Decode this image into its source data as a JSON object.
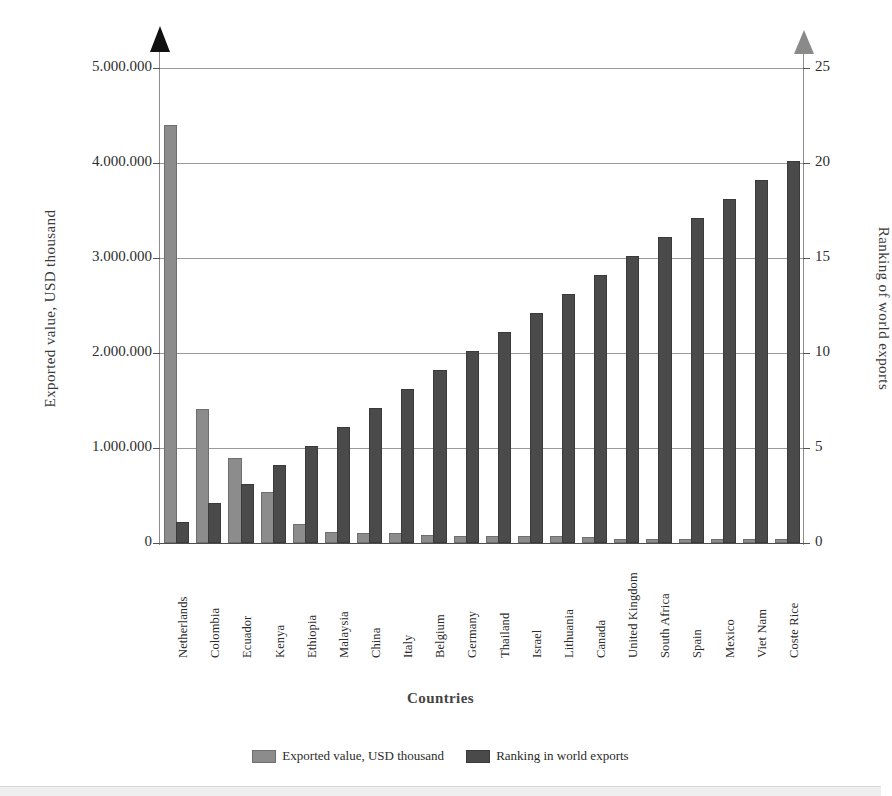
{
  "chart_data": {
    "type": "bar",
    "title": "",
    "xlabel": "Countries",
    "ylabel": "Exported value, USD thousand",
    "y2label": "Ranking of world exports",
    "ylim": [
      0,
      5000000
    ],
    "y2lim": [
      0,
      25
    ],
    "yticks": [
      "0",
      "1.000.000",
      "2.000.000",
      "3.000.000",
      "4.000.000",
      "5.000.000"
    ],
    "ytick_values": [
      0,
      1000000,
      2000000,
      3000000,
      4000000,
      5000000
    ],
    "y2ticks": [
      "0",
      "5",
      "10",
      "15",
      "20",
      "25"
    ],
    "y2tick_values": [
      0,
      5,
      10,
      15,
      20,
      25
    ],
    "grid": true,
    "legend_position": "bottom",
    "categories": [
      "Netherlands",
      "Colombia",
      "Ecuador",
      "Kenya",
      "Ethiopia",
      "Malaysia",
      "China",
      "Italy",
      "Belgium",
      "Germany",
      "Thailand",
      "Israel",
      "Lithuania",
      "Canada",
      "United Kingdom",
      "South Africa",
      "Spain",
      "Mexico",
      "Viet Nam",
      "Coste Rice"
    ],
    "series": [
      {
        "name": "Exported value, USD thousand",
        "axis": "left",
        "color": "#8c8c8c",
        "values": [
          4380000,
          1390000,
          870000,
          520000,
          180000,
          90000,
          85000,
          80000,
          65000,
          55000,
          50000,
          50000,
          50000,
          42000,
          25000,
          22000,
          20000,
          18000,
          16000,
          18000
        ]
      },
      {
        "name": "Ranking in world exports",
        "axis": "right",
        "color": "#4a4a4a",
        "values": [
          1,
          2,
          3,
          4,
          5,
          6,
          7,
          8,
          9,
          10,
          11,
          12,
          13,
          14,
          15,
          16,
          17,
          18,
          19,
          20
        ]
      }
    ]
  },
  "legend": {
    "items": [
      {
        "label": "Exported value, USD thousand",
        "color": "#8c8c8c"
      },
      {
        "label": "Ranking in world exports",
        "color": "#4a4a4a"
      }
    ]
  }
}
